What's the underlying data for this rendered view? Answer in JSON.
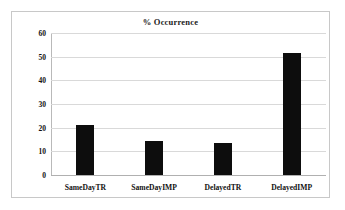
{
  "chart_data": {
    "type": "bar",
    "title": "% Occurrence",
    "xlabel": "",
    "ylabel": "",
    "categories": [
      "SameDayTR",
      "SameDayIMP",
      "DelayedTR",
      "DelayedIMP"
    ],
    "values": [
      21.3,
      14.5,
      13.6,
      51.5
    ],
    "ylim": [
      0,
      60
    ],
    "yticks": [
      0,
      10,
      20,
      30,
      40,
      50,
      60
    ],
    "ytick_labels": [
      "0",
      "10",
      "20",
      "30",
      "40",
      "50",
      "60"
    ],
    "grid": true,
    "legend": false,
    "bar_color": "#0d0d0d",
    "gridline_color": "#d9d9d9",
    "border_color": "#c8c8c8",
    "background_color": "#ffffff"
  }
}
